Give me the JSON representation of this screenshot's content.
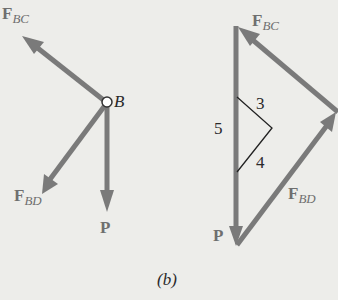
{
  "figure": {
    "caption": "(b)",
    "colors": {
      "background": "#ededea",
      "arrow": "#7a7a7a",
      "text_gray": "#6f6f6f",
      "text_dark": "#2a2a2a"
    },
    "free_body_diagram": {
      "node_label": "B",
      "forces": [
        {
          "name": "F",
          "subscript": "BC"
        },
        {
          "name": "F",
          "subscript": "BD"
        },
        {
          "name": "P",
          "subscript": ""
        }
      ]
    },
    "force_triangle": {
      "labels": [
        {
          "name": "F",
          "subscript": "BC"
        },
        {
          "name": "F",
          "subscript": "BD"
        },
        {
          "name": "P",
          "subscript": ""
        }
      ],
      "slope_triangle": {
        "side_a": "3",
        "side_b": "4",
        "hypotenuse": "5"
      }
    }
  }
}
